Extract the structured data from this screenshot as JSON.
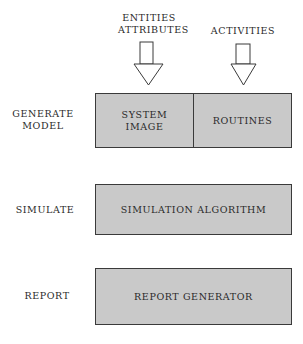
{
  "inputs": {
    "left_label_line1": "ENTITIES",
    "left_label_line2": "ATTRIBUTES",
    "right_label": "ACTIVITIES"
  },
  "stages": [
    {
      "label_line1": "GENERATE",
      "label_line2": "MODEL",
      "blocks": [
        {
          "line1": "SYSTEM",
          "line2": "IMAGE"
        },
        {
          "line1": "ROUTINES"
        }
      ]
    },
    {
      "label_line1": "SIMULATE",
      "blocks": [
        {
          "line1": "SIMULATION ALGORITHM"
        }
      ]
    },
    {
      "label_line1": "REPORT",
      "blocks": [
        {
          "line1": "REPORT GENERATOR"
        }
      ]
    }
  ],
  "colors": {
    "box_fill": "#c9c9c9",
    "stroke": "#3a3a3a"
  }
}
